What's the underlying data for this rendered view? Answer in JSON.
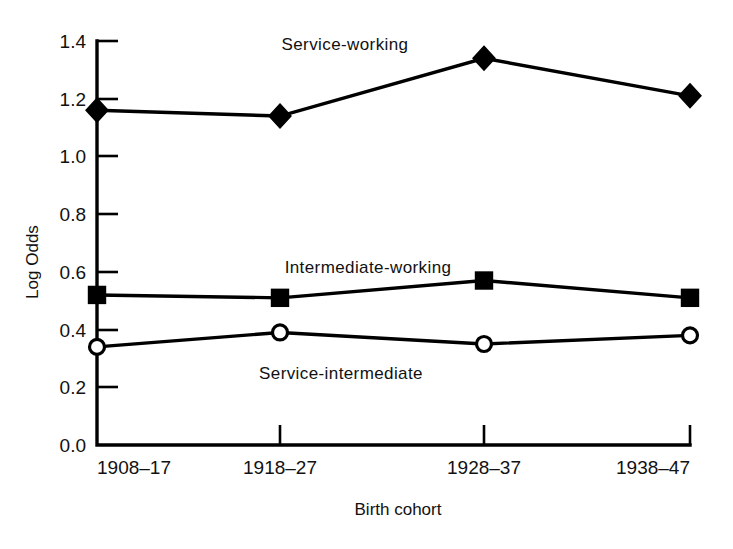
{
  "chart_data": {
    "type": "line",
    "title": "",
    "xlabel": "Birth cohort",
    "ylabel": "Log Odds",
    "categories": [
      "1908–17",
      "1918–27",
      "1928–37",
      "1938–47"
    ],
    "ylim": [
      0.0,
      1.4
    ],
    "ytick_labels": [
      "0.0",
      "0.2",
      "0.4",
      "0.6",
      "0.8",
      "1.0",
      "1.2",
      "1.4"
    ],
    "ytick_values": [
      0.0,
      0.2,
      0.4,
      0.6,
      0.8,
      1.0,
      1.2,
      1.4
    ],
    "grid": false,
    "legend_position": "inline-annotations",
    "series": [
      {
        "name": "Service-working",
        "marker": "filled-diamond",
        "values": [
          1.16,
          1.14,
          1.34,
          1.21
        ]
      },
      {
        "name": "Intermediate-working",
        "marker": "filled-square",
        "values": [
          0.52,
          0.51,
          0.57,
          0.51
        ]
      },
      {
        "name": "Service-intermediate",
        "marker": "open-circle",
        "values": [
          0.34,
          0.39,
          0.35,
          0.38
        ]
      }
    ]
  },
  "annotations": {
    "service_working": "Service-working",
    "intermediate_working": "Intermediate-working",
    "service_intermediate": "Service-intermediate"
  },
  "axes": {
    "y_title": "Log Odds",
    "x_title": "Birth cohort",
    "y_ticks": [
      "1.4",
      "1.2",
      "1.0",
      "0.8",
      "0.6",
      "0.4",
      "0.2",
      "0.0"
    ],
    "x_ticks": [
      "1908–17",
      "1918–27",
      "1928–37",
      "1938–47"
    ]
  },
  "colors": {
    "ink": "#000000",
    "background": "#ffffff"
  }
}
